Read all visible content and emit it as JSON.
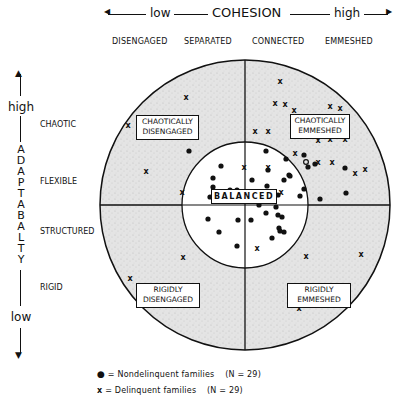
{
  "header": {
    "cohesion_axis": {
      "low_label": "low",
      "title": "COHESION",
      "high_label": "high"
    },
    "cohesion_levels": [
      "DISENGAGED",
      "SEPARATED",
      "CONNECTED",
      "EMMESHED"
    ]
  },
  "adaptability_axis": {
    "high_label": "high",
    "low_label": "low",
    "title_letters": [
      "A",
      "D",
      "A",
      "P",
      "T",
      "A",
      "B",
      "A",
      "L",
      "T",
      "Y"
    ],
    "levels": [
      "CHAOTIC",
      "FLEXIBLE",
      "STRUCTURED",
      "RIGID"
    ]
  },
  "regions": {
    "top_left": "CHAOTICALLY DISENGAGED",
    "top_left_lines": [
      "CHAOTICALLY",
      "DISENGAGED"
    ],
    "top_right_lines": [
      "CHAOTICALLY",
      "EMMESHED"
    ],
    "center": "BALANCED",
    "bottom_left_lines": [
      "RIGIDLY",
      "DISENGAGED"
    ],
    "bottom_right_lines": [
      "RIGIDLY",
      "EMMESHED"
    ]
  },
  "legend": {
    "nondelinquent": {
      "symbol": "●",
      "label": "= Nondelinquent families",
      "n": "(N = 29)"
    },
    "delinquent": {
      "symbol": "x",
      "label": "= Delinquent families",
      "n": "(N = 29)"
    }
  },
  "diagram_data": {
    "type": "circumplex",
    "outer_circle": {
      "cx": 245,
      "cy": 205,
      "r": 145
    },
    "inner_circle": {
      "cx": 245,
      "cy": 205,
      "r": 63
    },
    "dots": [
      [
        189,
        151
      ],
      [
        221,
        166
      ],
      [
        213,
        178
      ],
      [
        213,
        187
      ],
      [
        210,
        197
      ],
      [
        230,
        190
      ],
      [
        252,
        180
      ],
      [
        258,
        196
      ],
      [
        237,
        190
      ],
      [
        259,
        205
      ],
      [
        268,
        170
      ],
      [
        267,
        186
      ],
      [
        289,
        175
      ],
      [
        278,
        195
      ],
      [
        282,
        217
      ],
      [
        278,
        215
      ],
      [
        208,
        219
      ],
      [
        219,
        232
      ],
      [
        238,
        220
      ],
      [
        237,
        246
      ],
      [
        251,
        220
      ],
      [
        266,
        213
      ],
      [
        279,
        228
      ],
      [
        272,
        238
      ],
      [
        284,
        232
      ],
      [
        286,
        159
      ],
      [
        284,
        180
      ],
      [
        266,
        151
      ],
      [
        304,
        155
      ],
      [
        308,
        167
      ],
      [
        304,
        189
      ],
      [
        300,
        196
      ],
      [
        276,
        207
      ],
      [
        320,
        199
      ],
      [
        346,
        193
      ],
      [
        345,
        168
      ],
      [
        315,
        164
      ],
      [
        290,
        176
      ],
      [
        280,
        231
      ]
    ],
    "crosses": [
      [
        186,
        97
      ],
      [
        128,
        125
      ],
      [
        166,
        121
      ],
      [
        146,
        171
      ],
      [
        280,
        81
      ],
      [
        275,
        103
      ],
      [
        285,
        104
      ],
      [
        294,
        110
      ],
      [
        330,
        106
      ],
      [
        340,
        108
      ],
      [
        255,
        131
      ],
      [
        268,
        131
      ],
      [
        318,
        140
      ],
      [
        330,
        139
      ],
      [
        345,
        139
      ],
      [
        295,
        153
      ],
      [
        318,
        162
      ],
      [
        332,
        162
      ],
      [
        355,
        173
      ],
      [
        365,
        169
      ],
      [
        268,
        167
      ],
      [
        281,
        192
      ],
      [
        244,
        167
      ],
      [
        183,
        257
      ],
      [
        130,
        278
      ],
      [
        190,
        302
      ],
      [
        306,
        256
      ],
      [
        361,
        254
      ],
      [
        299,
        308
      ],
      [
        257,
        248
      ],
      [
        182,
        192
      ]
    ],
    "circles_open": [
      [
        306,
        162
      ]
    ]
  }
}
